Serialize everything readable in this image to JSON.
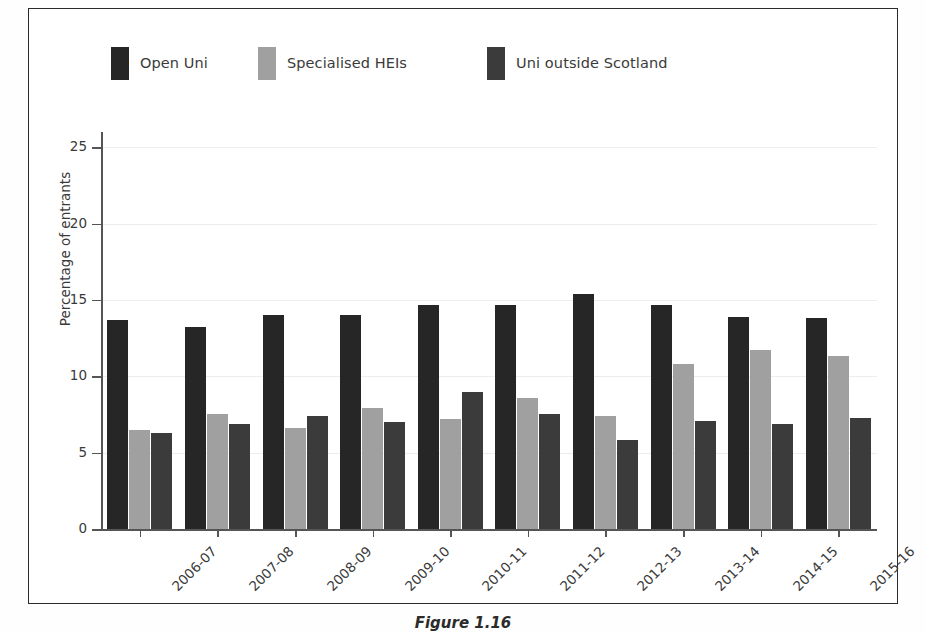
{
  "figure": {
    "caption": "Figure 1.16",
    "frame_color": "#2b2b2b",
    "background": "#ffffff"
  },
  "legend": {
    "position": "top-left",
    "entries": [
      {
        "label": "Open Uni",
        "color": "#262626",
        "swatch_name": "legend-swatch-open-uni"
      },
      {
        "label": "Specialised HEIs",
        "color": "#a0a0a0",
        "swatch_name": "legend-swatch-specialised-heis"
      },
      {
        "label": "Uni outside Scotland",
        "color": "#3b3b3b",
        "swatch_name": "legend-swatch-uni-outside-scotland"
      }
    ]
  },
  "chart_data": {
    "type": "bar",
    "title": "",
    "xlabel": "",
    "ylabel": "Percentage of entrants",
    "ylim": [
      0,
      26
    ],
    "yticks": [
      0,
      5,
      10,
      15,
      20,
      25
    ],
    "ytick_labels": [
      "0",
      "5",
      "10",
      "15",
      "20",
      "25"
    ],
    "grid": true,
    "grid_axis": "y",
    "legend_position": "top-left",
    "categories": [
      "2006-07",
      "2007-08",
      "2008-09",
      "2009-10",
      "2010-11",
      "2011-12",
      "2012-13",
      "2013-14",
      "2014-15",
      "2015-16"
    ],
    "series": [
      {
        "name": "Open Uni",
        "color": "#262626",
        "values": [
          13.7,
          13.2,
          14.0,
          14.0,
          14.7,
          14.7,
          15.4,
          14.7,
          13.9,
          13.8
        ]
      },
      {
        "name": "Specialised HEIs",
        "color": "#a0a0a0",
        "values": [
          6.5,
          7.5,
          6.6,
          7.9,
          7.2,
          8.6,
          7.4,
          10.8,
          11.7,
          11.3
        ]
      },
      {
        "name": "Uni outside Scotland",
        "color": "#3b3b3b",
        "values": [
          6.3,
          6.9,
          7.4,
          7.0,
          9.0,
          7.5,
          5.8,
          7.1,
          6.9,
          7.3
        ]
      }
    ]
  }
}
